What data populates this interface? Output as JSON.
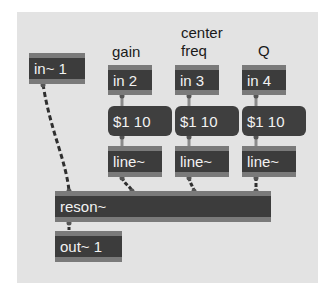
{
  "patch": {
    "labels": {
      "gain": "gain",
      "center_freq_line1": "center",
      "center_freq_line2": "freq",
      "q": "Q"
    },
    "objects": {
      "in_signal": "in~ 1",
      "in2": "in 2",
      "in3": "in 3",
      "in4": "in 4",
      "msg2": "$1 10",
      "msg3": "$1 10",
      "msg4": "$1 10",
      "line2": "line~",
      "line3": "line~",
      "line4": "line~",
      "reson": "reson~",
      "out": "out~ 1"
    },
    "colors": {
      "background": "#e3e3e3",
      "object_fill": "#3c3c3c",
      "object_border": "#7a7a7a",
      "object_text": "#f2f2f2",
      "signal_cord": "#3a3a3a",
      "control_cord": "#8a8a8a"
    }
  }
}
